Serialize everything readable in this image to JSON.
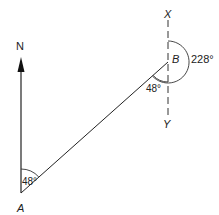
{
  "diagram": {
    "type": "bearing-diagram",
    "points": {
      "A": {
        "label": "A"
      },
      "B": {
        "label": "B"
      },
      "X": {
        "label": "X"
      },
      "Y": {
        "label": "Y"
      }
    },
    "north_label": "N",
    "angles": {
      "at_A": "48°",
      "at_B_interior": "48°",
      "at_B_reflex": "228°"
    },
    "colors": {
      "line": "#222222",
      "dashed": "#333333",
      "background": "#ffffff"
    }
  }
}
